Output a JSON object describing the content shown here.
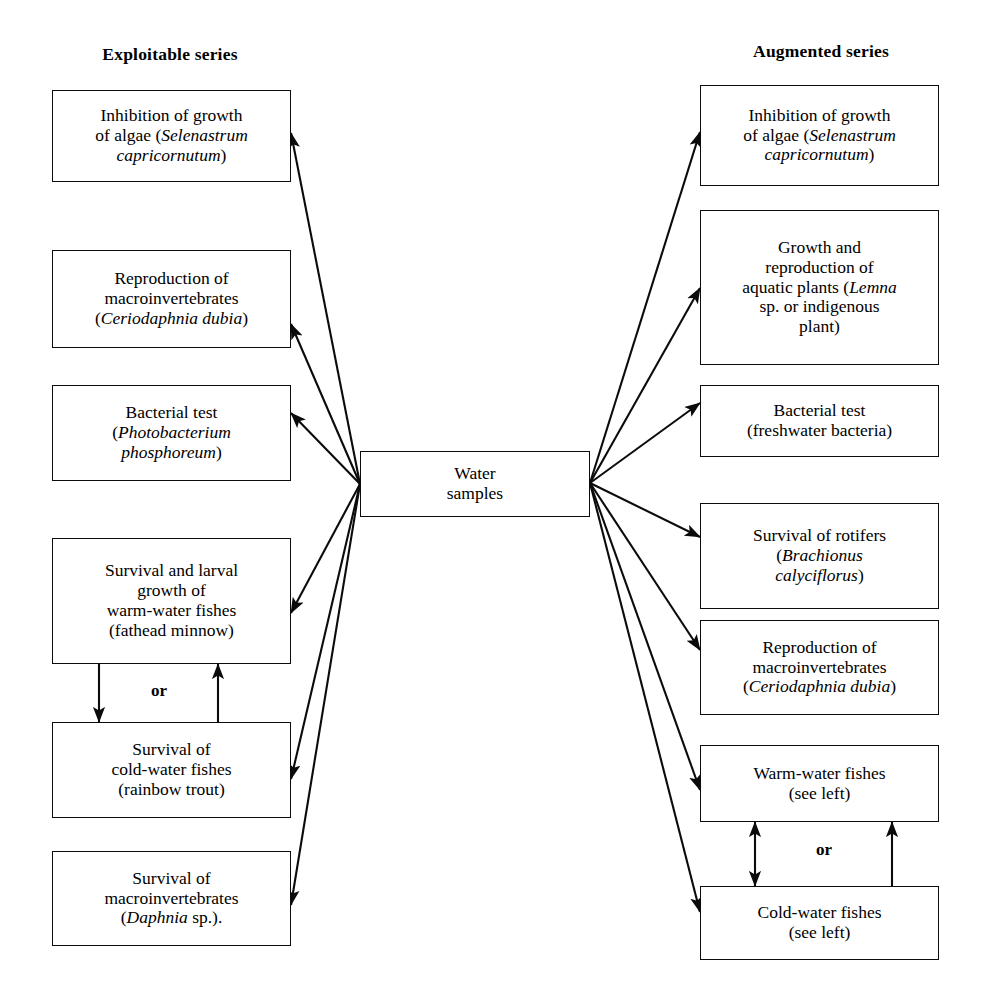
{
  "figure": {
    "type": "flow-diagram",
    "center_node": {
      "label": "Water\nsamples",
      "line1": "Water",
      "line2": "samples"
    },
    "columns": [
      {
        "id": "exploitable",
        "heading": "Exploitable series",
        "side": "left",
        "nodes": [
          {
            "id": "ex-algae",
            "lines": [
              "Inhibition of growth",
              "of algae (Selenastrum",
              "capricornutum)"
            ],
            "italic_parts": [
              "Selenastrum",
              "capricornutum"
            ]
          },
          {
            "id": "ex-macroinv",
            "lines": [
              "Reproduction of",
              "macroinvertebrates",
              "(Ceriodaphnia dubia)"
            ],
            "italic_parts": [
              "Ceriodaphnia dubia"
            ]
          },
          {
            "id": "ex-bacteria",
            "lines": [
              "Bacterial test",
              "(Photobacterium",
              "phosphoreum)"
            ],
            "italic_parts": [
              "Photobacterium",
              "phosphoreum"
            ]
          },
          {
            "id": "ex-warmfish",
            "lines": [
              "Survival and larval",
              "growth of",
              "warm-water fishes",
              "(fathead minnow)"
            ],
            "italic_parts": []
          },
          {
            "id": "ex-coldfish",
            "lines": [
              "Survival of",
              "cold-water fishes",
              "(rainbow trout)"
            ],
            "italic_parts": []
          },
          {
            "id": "ex-daphnia",
            "lines": [
              "Survival of",
              "macroinvertebrates",
              "(Daphnia sp.)."
            ],
            "italic_parts": [
              "Daphnia"
            ]
          }
        ],
        "or_label": "or"
      },
      {
        "id": "augmented",
        "heading": "Augmented series",
        "side": "right",
        "nodes": [
          {
            "id": "au-algae",
            "lines": [
              "Inhibition of growth",
              "of algae (Selenastrum",
              "capricornutum)"
            ],
            "italic_parts": [
              "Selenastrum",
              "capricornutum"
            ]
          },
          {
            "id": "au-plants",
            "lines": [
              "Growth and",
              "reproduction of",
              "aquatic plants (Lemna",
              "sp. or indigenous",
              "plant)"
            ],
            "italic_parts": [
              "Lemna"
            ]
          },
          {
            "id": "au-bacteria",
            "lines": [
              "Bacterial test",
              "(freshwater bacteria)"
            ],
            "italic_parts": []
          },
          {
            "id": "au-rotifers",
            "lines": [
              "Survival of rotifers",
              "(Brachionus",
              "calyciflorus)"
            ],
            "italic_parts": [
              "Brachionus",
              "calyciflorus"
            ]
          },
          {
            "id": "au-macroinv",
            "lines": [
              "Reproduction of",
              "macroinvertebrates",
              "(Ceriodaphnia dubia)"
            ],
            "italic_parts": [
              "Ceriodaphnia dubia"
            ]
          },
          {
            "id": "au-warmfish",
            "lines": [
              "Warm-water fishes",
              "(see left)"
            ],
            "italic_parts": []
          },
          {
            "id": "au-coldfish",
            "lines": [
              "Cold-water fishes",
              "(see left)"
            ],
            "italic_parts": []
          }
        ],
        "or_label": "or"
      }
    ],
    "colors": {
      "ink": "#0b0b0b",
      "background": "#ffffff"
    }
  },
  "headings": {
    "left": "Exploitable series",
    "right": "Augmented series"
  },
  "center": {
    "line1": "Water",
    "line2": "samples"
  },
  "left_nodes": {
    "n1_l1": "Inhibition of growth",
    "n1_l2a": "of algae (",
    "n1_l2b": "Selenastrum",
    "n1_l3a": "capricornutum",
    "n1_l3b": ")",
    "n2_l1": "Reproduction of",
    "n2_l2": "macroinvertebrates",
    "n2_l3a": "(",
    "n2_l3b": "Ceriodaphnia dubia",
    "n2_l3c": ")",
    "n3_l1": "Bacterial test",
    "n3_l2a": "(",
    "n3_l2b": "Photobacterium",
    "n3_l3a": "phosphoreum",
    "n3_l3b": ")",
    "n4_l1": "Survival and larval",
    "n4_l2": "growth of",
    "n4_l3": "warm-water fishes",
    "n4_l4": "(fathead minnow)",
    "n5_l1": "Survival of",
    "n5_l2": "cold-water fishes",
    "n5_l3": "(rainbow trout)",
    "n6_l1": "Survival of",
    "n6_l2": "macroinvertebrates",
    "n6_l3a": "(",
    "n6_l3b": "Daphnia",
    "n6_l3c": " sp.).",
    "or": "or"
  },
  "right_nodes": {
    "r1_l1": "Inhibition of growth",
    "r1_l2a": "of algae (",
    "r1_l2b": "Selenastrum",
    "r1_l3a": "capricornutum",
    "r1_l3b": ")",
    "r2_l1": "Growth and",
    "r2_l2": "reproduction of",
    "r2_l3a": "aquatic plants (",
    "r2_l3b": "Lemna",
    "r2_l4": "sp. or indigenous",
    "r2_l5": "plant)",
    "r3_l1": "Bacterial test",
    "r3_l2": "(freshwater bacteria)",
    "r4_l1": "Survival of rotifers",
    "r4_l2a": "(",
    "r4_l2b": "Brachionus",
    "r4_l3a": "calyciflorus",
    "r4_l3b": ")",
    "r5_l1": "Reproduction of",
    "r5_l2": "macroinvertebrates",
    "r5_l3a": "(",
    "r5_l3b": "Ceriodaphnia dubia",
    "r5_l3c": ")",
    "r6_l1": "Warm-water fishes",
    "r6_l2": "(see left)",
    "r7_l1": "Cold-water fishes",
    "r7_l2": "(see left)",
    "or": "or"
  }
}
